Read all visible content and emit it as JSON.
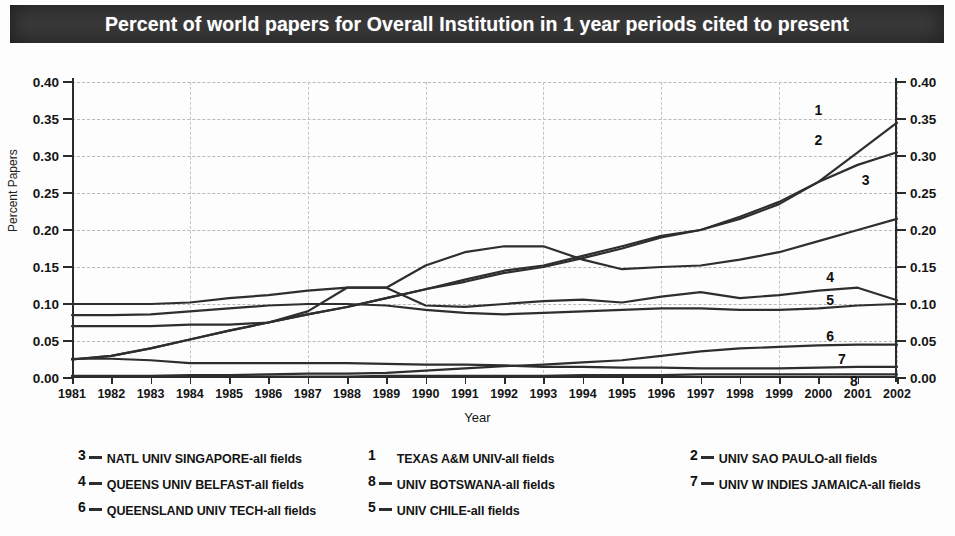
{
  "title": "Percent of world papers for Overall Institution in 1 year periods cited to present",
  "axis": {
    "y_title": "Percent Papers",
    "x_title": "Year",
    "y_ticks": [
      "0.00",
      "0.05",
      "0.10",
      "0.15",
      "0.20",
      "0.25",
      "0.30",
      "0.35",
      "0.40"
    ],
    "x_ticks": [
      "1981",
      "1982",
      "1983",
      "1984",
      "1985",
      "1986",
      "1987",
      "1988",
      "1989",
      "1990",
      "1991",
      "1992",
      "1993",
      "1994",
      "1995",
      "1996",
      "1997",
      "1998",
      "1999",
      "2000",
      "2001",
      "2002"
    ]
  },
  "legend": [
    {
      "num": "3",
      "label": "NATL UNIV SINGAPORE-all fields",
      "dash": true
    },
    {
      "num": "1",
      "label": "TEXAS A&M UNIV-all fields",
      "dash": false
    },
    {
      "num": "2",
      "label": "UNIV SAO PAULO-all fields",
      "dash": true
    },
    {
      "num": "4",
      "label": "QUEENS UNIV BELFAST-all fields",
      "dash": true
    },
    {
      "num": "8",
      "label": "UNIV BOTSWANA-all fields",
      "dash": true
    },
    {
      "num": "7",
      "label": "UNIV W INDIES JAMAICA-all fields",
      "dash": true
    },
    {
      "num": "6",
      "label": "QUEENSLAND UNIV TECH-all fields",
      "dash": true
    },
    {
      "num": "5",
      "label": "UNIV CHILE-all fields",
      "dash": true
    }
  ],
  "chart_data": {
    "type": "line",
    "title": "Percent of world papers for Overall Institution in 1 year periods cited to present",
    "xlabel": "Year",
    "ylabel": "Percent Papers",
    "xlim": [
      1981,
      2002
    ],
    "ylim": [
      0.0,
      0.4
    ],
    "grid": true,
    "legend_position": "below",
    "x": [
      1981,
      1982,
      1983,
      1984,
      1985,
      1986,
      1987,
      1988,
      1989,
      1990,
      1991,
      1992,
      1993,
      1994,
      1995,
      1996,
      1997,
      1998,
      1999,
      2000,
      2001,
      2002
    ],
    "series": [
      {
        "name": "TEXAS A&M UNIV-all fields",
        "number": "1",
        "end_label_value": 0.345,
        "values": [
          0.025,
          0.03,
          0.04,
          0.052,
          0.064,
          0.075,
          0.086,
          0.096,
          0.108,
          0.12,
          0.133,
          0.145,
          0.152,
          0.165,
          0.178,
          0.192,
          0.2,
          0.218,
          0.238,
          0.265,
          0.305,
          0.345
        ]
      },
      {
        "name": "UNIV SAO PAULO-all fields",
        "number": "2",
        "end_label_value": 0.305,
        "values": [
          0.025,
          0.03,
          0.04,
          0.052,
          0.064,
          0.075,
          0.086,
          0.096,
          0.108,
          0.12,
          0.13,
          0.142,
          0.15,
          0.162,
          0.175,
          0.19,
          0.2,
          0.215,
          0.235,
          0.265,
          0.288,
          0.305
        ]
      },
      {
        "name": "NATL UNIV SINGAPORE-all fields",
        "number": "3",
        "end_label_value": 0.305,
        "values": [
          0.07,
          0.07,
          0.07,
          0.072,
          0.072,
          0.075,
          0.09,
          0.122,
          0.122,
          0.152,
          0.17,
          0.178,
          0.178,
          0.16,
          0.147,
          0.15,
          0.152,
          0.16,
          0.17,
          0.185,
          0.2,
          0.215
        ]
      },
      {
        "name": "QUEENS UNIV BELFAST-all fields",
        "number": "4",
        "end_label_value": 0.105,
        "values": [
          0.1,
          0.1,
          0.1,
          0.102,
          0.108,
          0.112,
          0.118,
          0.122,
          0.122,
          0.098,
          0.096,
          0.1,
          0.104,
          0.106,
          0.102,
          0.11,
          0.116,
          0.108,
          0.112,
          0.118,
          0.122,
          0.105
        ]
      },
      {
        "name": "UNIV CHILE-all fields",
        "number": "5",
        "end_label_value": 0.1,
        "values": [
          0.085,
          0.085,
          0.086,
          0.09,
          0.094,
          0.098,
          0.1,
          0.1,
          0.098,
          0.092,
          0.088,
          0.086,
          0.088,
          0.09,
          0.092,
          0.094,
          0.094,
          0.092,
          0.092,
          0.094,
          0.098,
          0.1
        ]
      },
      {
        "name": "QUEENSLAND UNIV TECH-all fields",
        "number": "6",
        "end_label_value": 0.045,
        "values": [
          0.003,
          0.003,
          0.003,
          0.004,
          0.004,
          0.005,
          0.006,
          0.006,
          0.007,
          0.01,
          0.013,
          0.016,
          0.018,
          0.021,
          0.024,
          0.03,
          0.036,
          0.04,
          0.042,
          0.044,
          0.045,
          0.045
        ]
      },
      {
        "name": "UNIV W INDIES JAMAICA-all fields",
        "number": "7",
        "end_label_value": 0.015,
        "values": [
          0.026,
          0.026,
          0.024,
          0.02,
          0.02,
          0.02,
          0.02,
          0.02,
          0.019,
          0.018,
          0.018,
          0.017,
          0.015,
          0.015,
          0.014,
          0.014,
          0.013,
          0.013,
          0.013,
          0.014,
          0.015,
          0.015
        ]
      },
      {
        "name": "UNIV BOTSWANA-all fields",
        "number": "8",
        "end_label_value": 0.005,
        "values": [
          0.002,
          0.002,
          0.002,
          0.002,
          0.002,
          0.002,
          0.002,
          0.002,
          0.003,
          0.003,
          0.003,
          0.003,
          0.003,
          0.004,
          0.004,
          0.004,
          0.005,
          0.005,
          0.005,
          0.005,
          0.005,
          0.005
        ]
      }
    ],
    "inline_labels": [
      {
        "text": "1",
        "x": 2000.0,
        "y": 0.362
      },
      {
        "text": "2",
        "x": 2000.0,
        "y": 0.322
      },
      {
        "text": "3",
        "x": 2001.2,
        "y": 0.268
      },
      {
        "text": "4",
        "x": 2000.3,
        "y": 0.137
      },
      {
        "text": "5",
        "x": 2000.3,
        "y": 0.105
      },
      {
        "text": "6",
        "x": 2000.3,
        "y": 0.057
      },
      {
        "text": "7",
        "x": 2000.6,
        "y": 0.026
      },
      {
        "text": "8",
        "x": 2000.9,
        "y": -0.004
      }
    ]
  }
}
